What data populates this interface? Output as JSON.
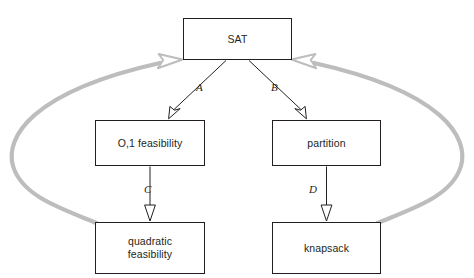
{
  "diagram": {
    "colors": {
      "node_stroke": "#231f20",
      "node_fill": "#ffffff",
      "black_edge": "#231f20",
      "gray_edge": "#bdbdbd",
      "background": "#ffffff"
    },
    "nodes": [
      {
        "id": "sat",
        "label": "SAT",
        "x": 183,
        "y": 18,
        "w": 109,
        "h": 42
      },
      {
        "id": "zo",
        "label": "O,1 feasibility",
        "x": 95,
        "y": 120,
        "w": 110,
        "h": 46
      },
      {
        "id": "partition",
        "label": "partition",
        "x": 272,
        "y": 120,
        "w": 109,
        "h": 46
      },
      {
        "id": "quadratic",
        "label": "quadratic\nfeasibility",
        "x": 95,
        "y": 222,
        "w": 110,
        "h": 52
      },
      {
        "id": "knapsack",
        "label": "knapsack",
        "x": 272,
        "y": 222,
        "w": 109,
        "h": 52
      }
    ],
    "edges": [
      {
        "id": "a",
        "label": "A",
        "from": "sat",
        "to": "zo",
        "style": "black-straight",
        "arrowhead": "hollow-black"
      },
      {
        "id": "b",
        "label": "B",
        "from": "sat",
        "to": "partition",
        "style": "black-straight",
        "arrowhead": "hollow-black"
      },
      {
        "id": "c",
        "label": "C",
        "from": "zo",
        "to": "quadratic",
        "style": "black-straight",
        "arrowhead": "hollow-black"
      },
      {
        "id": "d",
        "label": "D",
        "from": "partition",
        "to": "knapsack",
        "style": "black-straight",
        "arrowhead": "hollow-black"
      },
      {
        "id": "left-loop",
        "label": "",
        "from": "quadratic",
        "to": "sat",
        "style": "gray-curve",
        "arrowhead": "hollow-gray"
      },
      {
        "id": "right-loop",
        "label": "",
        "from": "knapsack",
        "to": "sat",
        "style": "gray-curve",
        "arrowhead": "hollow-gray"
      }
    ]
  }
}
